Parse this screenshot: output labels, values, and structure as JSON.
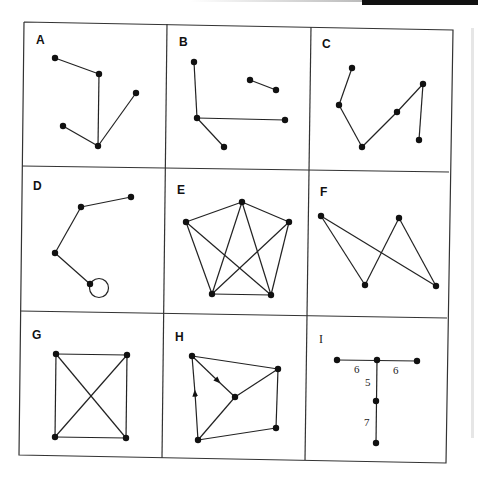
{
  "figure": {
    "panels": [
      {
        "id": "A",
        "label": "A"
      },
      {
        "id": "B",
        "label": "B"
      },
      {
        "id": "C",
        "label": "C"
      },
      {
        "id": "D",
        "label": "D"
      },
      {
        "id": "E",
        "label": "E"
      },
      {
        "id": "F",
        "label": "F"
      },
      {
        "id": "G",
        "label": "G"
      },
      {
        "id": "H",
        "label": "H"
      },
      {
        "id": "I",
        "label": "I",
        "edge_weights": [
          "6",
          "6",
          "5",
          "7"
        ]
      }
    ]
  },
  "colors": {
    "line": "#222222",
    "node": "#111111",
    "background": "#ffffff"
  }
}
